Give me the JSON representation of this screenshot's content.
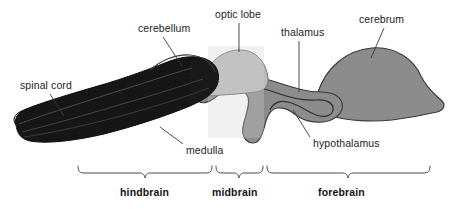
{
  "figure": {
    "background_color": "#ffffff",
    "ink_color": "#1d1d1d"
  },
  "structure_labels": [
    {
      "id": "spinal-cord",
      "text": "spinal cord",
      "x": 20,
      "y": 80,
      "leader": [
        [
          50,
          94
        ],
        [
          64,
          116
        ]
      ]
    },
    {
      "id": "cerebellum",
      "text": "cerebellum",
      "x": 138,
      "y": 23,
      "leader": [
        [
          163,
          37
        ],
        [
          182,
          66
        ]
      ]
    },
    {
      "id": "optic-lobe",
      "text": "optic lobe",
      "x": 215,
      "y": 9,
      "leader": [
        [
          239,
          23
        ],
        [
          239,
          52
        ]
      ]
    },
    {
      "id": "thalamus",
      "text": "thalamus",
      "x": 281,
      "y": 27,
      "leader": [
        [
          299,
          41
        ],
        [
          299,
          92
        ]
      ]
    },
    {
      "id": "cerebrum",
      "text": "cerebrum",
      "x": 359,
      "y": 14,
      "leader": [
        [
          384,
          28
        ],
        [
          371,
          58
        ]
      ]
    },
    {
      "id": "medulla",
      "text": "medulla",
      "x": 186,
      "y": 145,
      "leader": [
        [
          183,
          144
        ],
        [
          160,
          127
        ]
      ]
    },
    {
      "id": "hypothalamus",
      "text": "hypothalamus",
      "x": 313,
      "y": 138,
      "leader": [
        [
          310,
          137
        ],
        [
          293,
          110
        ]
      ]
    }
  ],
  "region_brackets": [
    {
      "id": "hindbrain",
      "label": "hindbrain",
      "left": 78,
      "right": 212,
      "label_x": 120,
      "label_y": 186
    },
    {
      "id": "midbrain",
      "label": "midbrain",
      "left": 216,
      "right": 263,
      "label_x": 212,
      "label_y": 186
    },
    {
      "id": "forebrain",
      "label": "forebrain",
      "left": 267,
      "right": 430,
      "label_x": 318,
      "label_y": 186
    }
  ],
  "bracket_geometry": {
    "top_y": 166,
    "bottom_y": 178,
    "stroke": "#4a4a4a"
  },
  "brain_parts": [
    {
      "id": "hindbrain-mass",
      "name": "hindbrain-cerebellum-medulla",
      "fill": "#141414",
      "region": "hindbrain"
    },
    {
      "id": "optic-lobe-mass",
      "name": "optic-lobe",
      "fill": "#b9b9b9",
      "region": "midbrain"
    },
    {
      "id": "forebrain-mass",
      "name": "forebrain-thalamus-cerebrum",
      "fill": "#8d8d8d",
      "region": "forebrain"
    },
    {
      "id": "cerebrum-mass",
      "name": "cerebrum",
      "fill": "#8a8a8a",
      "region": "forebrain"
    }
  ],
  "colors": {
    "hindbrain_dark": "#141414",
    "midbrain_light": "#bdbdbd",
    "forebrain_grey": "#8d8d8d",
    "outline": "#2a2a2a",
    "bracket": "#4a4a4a",
    "text": "#1d1d1d"
  }
}
